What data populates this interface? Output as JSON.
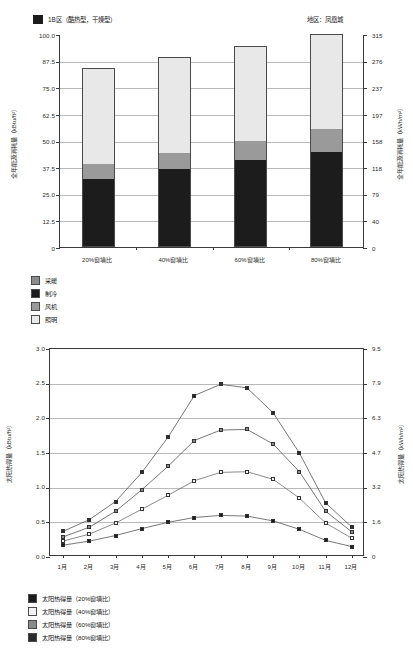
{
  "page": {
    "top_chart_header_legend": "1B区（酷热型，干燥型）",
    "top_chart_region_label": "地区：凤凰城"
  },
  "colors": {
    "heating": "#8c8c8c",
    "cooling": "#1c1c1c",
    "fan": "#9a9a9a",
    "lighting": "#e8e8e8",
    "series_20": "#1c1c1c",
    "series_40": "#f2f2f2",
    "series_60": "#8a8a8a",
    "series_80": "#2a2a2a",
    "grid": "#b9b9b9",
    "axis": "#3a3a3a"
  },
  "chart_data": [
    {
      "type": "bar",
      "id": "annual-energy-consumption",
      "title": "1B区（酷热型，干燥型）",
      "annotation": "地区：凤凰城",
      "stacked": true,
      "grid": true,
      "legend_position": "below",
      "categories": [
        "20%窗墙比",
        "40%窗墙比",
        "60%窗墙比",
        "80%窗墙比"
      ],
      "xlabel": "",
      "ylabel": "全年能源消耗量（kBtu/ft²）",
      "ylim": [
        0,
        100
      ],
      "yticks": [
        "0",
        "12.5",
        "25.0",
        "37.5",
        "50.0",
        "62.5",
        "75.0",
        "87.5",
        "100.0"
      ],
      "y2label": "全年能源消耗量（kWh/m²）",
      "y2lim": [
        0,
        315
      ],
      "y2ticks": [
        "0",
        "40",
        "79",
        "118",
        "158",
        "197",
        "237",
        "276",
        "315"
      ],
      "series": [
        {
          "name": "采暖",
          "color": "#8c8c8c",
          "values": [
            0,
            0,
            0,
            0
          ]
        },
        {
          "name": "制冷",
          "color": "#1c1c1c",
          "values": [
            32.0,
            36.5,
            41.0,
            44.5
          ]
        },
        {
          "name": "风机",
          "color": "#9a9a9a",
          "values": [
            7.0,
            7.5,
            9.0,
            11.0
          ]
        },
        {
          "name": "照明",
          "color": "#e8e8e8",
          "values": [
            45.0,
            45.0,
            44.5,
            44.5
          ]
        }
      ],
      "totals": [
        84.0,
        89.0,
        94.5,
        100.0
      ]
    },
    {
      "type": "line",
      "id": "monthly-solar-heat-gain",
      "title": "",
      "grid": true,
      "legend_position": "below",
      "categories": [
        "1月",
        "2月",
        "3月",
        "4月",
        "5月",
        "6月",
        "7月",
        "8月",
        "9月",
        "10月",
        "11月",
        "12月"
      ],
      "xlabel": "",
      "ylabel": "太阳热得量（kBtu/ft²）",
      "ylim": [
        0,
        3.0
      ],
      "yticks": [
        "0.0",
        "0.5",
        "1.0",
        "1.5",
        "2.0",
        "2.5",
        "3.0"
      ],
      "y2label": "太阳热得量（kWh/m²）",
      "y2lim": [
        0,
        9.5
      ],
      "y2ticks": [
        "0",
        "1.6",
        "3.2",
        "4.7",
        "6.3",
        "7.9",
        "9.5"
      ],
      "series": [
        {
          "name": "太阳热得量（20%窗墙比）",
          "color": "#1c1c1c",
          "marker": "filled-square",
          "values": [
            0.17,
            0.23,
            0.31,
            0.41,
            0.5,
            0.57,
            0.6,
            0.59,
            0.52,
            0.4,
            0.24,
            0.15
          ]
        },
        {
          "name": "太阳热得量（40%窗墙比）",
          "color": "#f2f2f2",
          "marker": "open-square",
          "values": [
            0.23,
            0.33,
            0.49,
            0.69,
            0.89,
            1.1,
            1.22,
            1.23,
            1.12,
            0.85,
            0.49,
            0.27
          ]
        },
        {
          "name": "太阳热得量（60%窗墙比）",
          "color": "#8a8a8a",
          "marker": "half-square",
          "values": [
            0.29,
            0.43,
            0.66,
            0.97,
            1.31,
            1.68,
            1.83,
            1.84,
            1.63,
            1.23,
            0.66,
            0.36
          ]
        },
        {
          "name": "太阳热得量（80%窗墙比）",
          "color": "#2a2a2a",
          "marker": "filled-square",
          "values": [
            0.37,
            0.54,
            0.8,
            1.22,
            1.73,
            2.33,
            2.49,
            2.44,
            2.08,
            1.5,
            0.78,
            0.43
          ]
        }
      ]
    }
  ],
  "top_legend": [
    {
      "label": "采暖",
      "color": "#8c8c8c"
    },
    {
      "label": "制冷",
      "color": "#1c1c1c"
    },
    {
      "label": "风机",
      "color": "#9a9a9a"
    },
    {
      "label": "照明",
      "color": "#e8e8e8"
    }
  ],
  "bottom_legend": [
    {
      "label": "太阳热得量（20%窗墙比）",
      "color": "#1c1c1c"
    },
    {
      "label": "太阳热得量（40%窗墙比）",
      "color": "#f2f2f2"
    },
    {
      "label": "太阳热得量（60%窗墙比）",
      "color": "#8a8a8a"
    },
    {
      "label": "太阳热得量（80%窗墙比）",
      "color": "#2a2a2a"
    }
  ]
}
